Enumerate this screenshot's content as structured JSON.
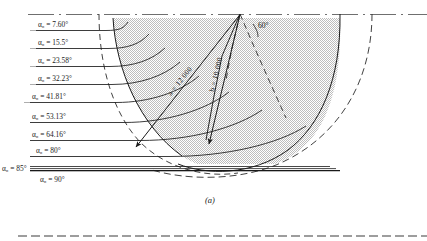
{
  "figure": {
    "caption": "(a)",
    "angle_symbol": "α",
    "angle_subscript": "0",
    "degree": "°",
    "apex_angle_label": "60°",
    "vectors": [
      {
        "name": "vector-a",
        "label": "a = 12 000",
        "value": 12000,
        "symbol": "a"
      },
      {
        "name": "vector-b",
        "label": "b = 10 000",
        "value": 10000,
        "symbol": "b"
      }
    ],
    "alpha_labels": [
      {
        "text": "α₀ = 7.60°",
        "value": 7.6
      },
      {
        "text": "α₀ = 15.5°",
        "value": 15.5
      },
      {
        "text": "α₀ = 23.58°",
        "value": 23.58
      },
      {
        "text": "α₀ = 32.23°",
        "value": 32.23
      },
      {
        "text": "α₀ = 41.81°",
        "value": 41.81
      },
      {
        "text": "α₀ = 53.13°",
        "value": 53.13
      },
      {
        "text": "α₀ = 64.16°",
        "value": 64.16
      },
      {
        "text": "α₀ = 80°",
        "value": 80
      },
      {
        "text": "α₀ = 85°",
        "value": 85
      },
      {
        "text": "α₀ = 90°",
        "value": 90
      }
    ],
    "colors": {
      "ink": "#1a1a1a",
      "shade": "#d9d9d9",
      "rule": "#8a8a8a"
    }
  }
}
